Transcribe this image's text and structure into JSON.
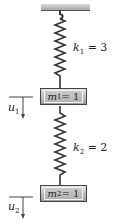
{
  "diagram": {
    "type": "spring-mass-system",
    "ceiling": {
      "color_top": "#d8d8d8",
      "color_bottom": "#a9a9a9"
    },
    "springs": [
      {
        "id": "spring-1",
        "symbol": "k",
        "subscript": "1",
        "equals": "= 3",
        "value": 3
      },
      {
        "id": "spring-2",
        "symbol": "k",
        "subscript": "2",
        "equals": "= 2",
        "value": 2
      }
    ],
    "masses": [
      {
        "id": "mass-1",
        "symbol": "m",
        "subscript": "1",
        "equals": " = 1",
        "value": 1
      },
      {
        "id": "mass-2",
        "symbol": "m",
        "subscript": "2",
        "equals": " = 1",
        "value": 1
      }
    ],
    "displacements": [
      {
        "id": "u1",
        "symbol": "u",
        "subscript": "1",
        "direction": "down"
      },
      {
        "id": "u2",
        "symbol": "u",
        "subscript": "2",
        "direction": "down"
      }
    ]
  }
}
